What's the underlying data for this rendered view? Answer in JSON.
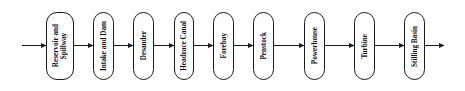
{
  "diagram": {
    "type": "flowchart",
    "direction": "left-to-right",
    "nodes": [
      {
        "id": "reservoir",
        "label": "Reservoir and\nSpillway"
      },
      {
        "id": "intake",
        "label": "Intake and Dam"
      },
      {
        "id": "desander",
        "label": "Desander"
      },
      {
        "id": "headrace",
        "label": "Headrace Canal"
      },
      {
        "id": "forebay",
        "label": "Forebay"
      },
      {
        "id": "penstock",
        "label": "Penstock"
      },
      {
        "id": "powerhouse",
        "label": "Powerhouse"
      },
      {
        "id": "turbine",
        "label": "Turbine"
      },
      {
        "id": "stilling",
        "label": "Stilling Basin"
      }
    ],
    "edges": [
      {
        "from": "input",
        "to": "reservoir"
      },
      {
        "from": "reservoir",
        "to": "intake"
      },
      {
        "from": "intake",
        "to": "desander"
      },
      {
        "from": "desander",
        "to": "headrace"
      },
      {
        "from": "headrace",
        "to": "forebay"
      },
      {
        "from": "forebay",
        "to": "penstock"
      },
      {
        "from": "penstock",
        "to": "powerhouse"
      },
      {
        "from": "powerhouse",
        "to": "turbine"
      },
      {
        "from": "turbine",
        "to": "stilling"
      },
      {
        "from": "stilling",
        "to": "output"
      }
    ],
    "colors": {
      "stroke": "#1a1a1a",
      "fill": "#ffffff",
      "text": "#111111"
    }
  }
}
